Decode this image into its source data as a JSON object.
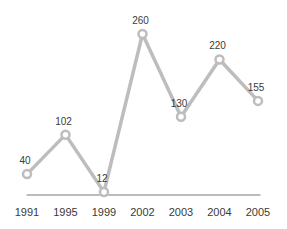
{
  "chart_data": {
    "type": "line",
    "categories": [
      "1991",
      "1995",
      "1999",
      "2002",
      "2003",
      "2004",
      "2005"
    ],
    "values": [
      40,
      102,
      12,
      260,
      130,
      220,
      155
    ],
    "title": "",
    "xlabel": "",
    "ylabel": "",
    "ylim": [
      0,
      260
    ],
    "grid": false,
    "legend_position": "none",
    "marker_style": "open-circle",
    "show_point_labels": true,
    "x_axis_line": true,
    "y_axis_line": false
  },
  "style": {
    "line_color": "#bdbdbd",
    "marker_stroke": "#bdbdbd",
    "marker_fill": "#ffffff",
    "label_color": "#3a3a3a",
    "axis_label_color": "#3a3a3a",
    "axis_line_color": "#7a7a7a",
    "background": "#ffffff"
  }
}
